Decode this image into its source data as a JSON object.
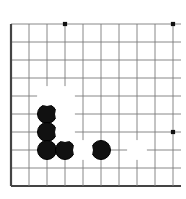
{
  "figure": {
    "kind": "go-board-diagram",
    "board_size": 19,
    "view": {
      "columns_visible": 10,
      "rows_visible": 10,
      "corner": "bottom-left"
    },
    "colors": {
      "background": "#ffffff",
      "grid_line": "#7a7a7a",
      "edge_line": "#444444",
      "black_stone": "#111111",
      "white_stone": "#ffffff",
      "white_stone_border": "#555555",
      "star_point": "#111111"
    }
  },
  "chart_data": {
    "type": "scatter",
    "xlabel": "",
    "ylabel": "",
    "grid": true,
    "xlim": [
      0,
      9
    ],
    "ylim": [
      0,
      9
    ],
    "geometry": {
      "origin_x": 11,
      "origin_y": 24,
      "spacing": 18,
      "lines_horizontal": 10,
      "lines_vertical": 10,
      "stone_diameter": 20
    },
    "edges": {
      "left": true,
      "bottom": true,
      "top": false,
      "right": false
    },
    "star_points": [
      {
        "col": 3,
        "row": 0
      },
      {
        "col": 9,
        "row": 0
      },
      {
        "col": 9,
        "row": 6
      }
    ],
    "series": [
      {
        "name": "Black stones",
        "color": "#111111",
        "values": [
          {
            "col": 2,
            "row": 5
          },
          {
            "col": 2,
            "row": 6
          },
          {
            "col": 2,
            "row": 7
          },
          {
            "col": 3,
            "row": 7
          },
          {
            "col": 5,
            "row": 7
          }
        ]
      },
      {
        "name": "White stones",
        "color": "#ffffff",
        "values": [
          {
            "col": 2,
            "row": 4
          },
          {
            "col": 3,
            "row": 4
          },
          {
            "col": 3,
            "row": 5
          },
          {
            "col": 3,
            "row": 6
          },
          {
            "col": 4,
            "row": 7
          },
          {
            "col": 7,
            "row": 7
          }
        ]
      }
    ]
  }
}
